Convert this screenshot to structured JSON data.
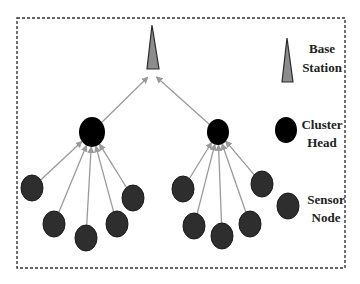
{
  "colors": {
    "background": "#ffffff",
    "border": "#333333",
    "base_station_fill": "#8c8c8c",
    "base_station_stroke": "#2a2a2a",
    "cluster_head_fill": "#000000",
    "sensor_node_fill": "#2e2e2e",
    "sensor_node_stroke": "#1a1a1a",
    "link": "#9a9a9a"
  },
  "diagram": {
    "frame": {
      "x": 17,
      "y": 18,
      "width": 328,
      "height": 250,
      "style": "dashed"
    },
    "base_station": {
      "tip": [
        152,
        25
      ],
      "base_left": [
        147,
        69
      ],
      "base_right": [
        159,
        69
      ]
    },
    "cluster_heads": [
      {
        "id": "CH1",
        "cx": 92,
        "cy": 132,
        "rx": 13,
        "ry": 15
      },
      {
        "id": "CH2",
        "cx": 218,
        "cy": 132,
        "rx": 11,
        "ry": 13
      }
    ],
    "sensor_nodes": [
      {
        "id": "S1",
        "cluster": "CH1",
        "cx": 32,
        "cy": 188
      },
      {
        "id": "S2",
        "cluster": "CH1",
        "cx": 54,
        "cy": 224
      },
      {
        "id": "S3",
        "cluster": "CH1",
        "cx": 86,
        "cy": 238
      },
      {
        "id": "S4",
        "cluster": "CH1",
        "cx": 117,
        "cy": 224
      },
      {
        "id": "S5",
        "cluster": "CH1",
        "cx": 133,
        "cy": 198
      },
      {
        "id": "S6",
        "cluster": "CH2",
        "cx": 183,
        "cy": 189
      },
      {
        "id": "S7",
        "cluster": "CH2",
        "cx": 194,
        "cy": 226
      },
      {
        "id": "S8",
        "cluster": "CH2",
        "cx": 222,
        "cy": 236
      },
      {
        "id": "S9",
        "cluster": "CH2",
        "cx": 250,
        "cy": 224
      },
      {
        "id": "S10",
        "cluster": "CH2",
        "cx": 262,
        "cy": 184
      }
    ],
    "links": [
      {
        "from": "CH1",
        "to": "BS"
      },
      {
        "from": "CH2",
        "to": "BS"
      },
      {
        "from": "S1",
        "to": "CH1"
      },
      {
        "from": "S2",
        "to": "CH1"
      },
      {
        "from": "S3",
        "to": "CH1"
      },
      {
        "from": "S4",
        "to": "CH1"
      },
      {
        "from": "S5",
        "to": "CH1"
      },
      {
        "from": "S6",
        "to": "CH2"
      },
      {
        "from": "S7",
        "to": "CH2"
      },
      {
        "from": "S8",
        "to": "CH2"
      },
      {
        "from": "S9",
        "to": "CH2"
      },
      {
        "from": "S10",
        "to": "CH2"
      }
    ]
  },
  "legend": {
    "base_station": {
      "line1": "Base",
      "line2": "Station"
    },
    "cluster_head": {
      "line1": "Cluster",
      "line2": "Head"
    },
    "sensor_node": {
      "line1": "Sensor",
      "line2": "Node"
    }
  }
}
